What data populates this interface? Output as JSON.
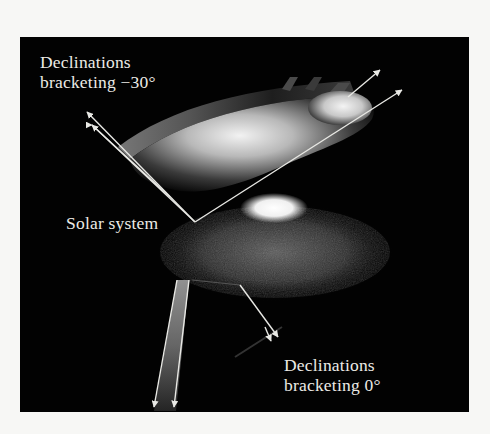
{
  "figure": {
    "background_color": "#020202",
    "page_color": "#f7f7f5",
    "label_color": "#ecebe6",
    "labels": {
      "upper_declination": {
        "line1": "Declinations",
        "line2": "bracketing −30°"
      },
      "solar_system": "Solar system",
      "lower_declination": {
        "line1": "Declinations",
        "line2": "bracketing 0°"
      }
    },
    "elements": [
      {
        "name": "declination-band-minus-30",
        "description": "curved band of sky at declination -30 degrees"
      },
      {
        "name": "galactic-bulge-ellipsoid",
        "description": "bright ellipsoid of stars toward declination -30"
      },
      {
        "name": "galaxy-disk",
        "description": "spiral disk with bright central bulge"
      },
      {
        "name": "declination-band-0",
        "description": "narrow band of sky at declination 0 degrees"
      },
      {
        "name": "sight-line-arrows",
        "description": "pairs of arrows from the solar system bracketing each survey region"
      }
    ]
  }
}
